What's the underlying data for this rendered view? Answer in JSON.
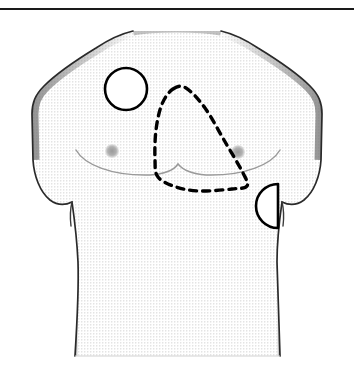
{
  "figure": {
    "kind": "anatomical-line-drawing",
    "canvas": {
      "width": 354,
      "height": 374
    },
    "background_color": "#ffffff",
    "ink_color": "#000000",
    "skin_fill_color": "#fcfcfc",
    "stipple_color": "#b9b9b9",
    "shade_color": "#8f8f8f",
    "nipple_color": "#a8a8a8",
    "fold_line_color": "#9a9a9a"
  },
  "rule": {
    "name": "top-horizontal-rule",
    "y": 9,
    "x_start": 0,
    "x_end": 354,
    "thickness": 2.2,
    "color": "#1a1a1a"
  },
  "torso": {
    "label": "male-chest-torso",
    "neck_left_x": 133,
    "neck_right_x": 218,
    "neck_top_y": 31,
    "shoulder_left_x": 32,
    "shoulder_right_x": 322,
    "armpit_left": {
      "x": 72,
      "y": 202
    },
    "armpit_right": {
      "x": 277,
      "y": 200
    },
    "waist_left_x": 78,
    "waist_right_x": 274,
    "bottom_y": 356,
    "outline_width": 1.6
  },
  "nipples": [
    {
      "name": "nipple-left",
      "cx": 112,
      "cy": 151,
      "r": 7
    },
    {
      "name": "nipple-right",
      "cx": 238,
      "cy": 152,
      "r": 7
    }
  ],
  "pectoral_folds": [
    {
      "name": "inframammary-fold-left",
      "from_x": 74,
      "to_x": 177,
      "y": 173
    },
    {
      "name": "inframammary-fold-right",
      "from_x": 177,
      "to_x": 278,
      "y": 173
    }
  ],
  "markers": [
    {
      "name": "circle-marker-upper-right-chest",
      "shape": "circle",
      "cx": 126,
      "cy": 89,
      "r": 21,
      "stroke": "#000000",
      "stroke_width": 2.6,
      "fill": "#ffffff",
      "dashed": false
    },
    {
      "name": "semicircle-marker-left-axilla",
      "shape": "semicircle",
      "flat_edge_x": 278,
      "cy": 206,
      "r": 22,
      "bulge_direction": "left",
      "stroke": "#000000",
      "stroke_width": 2.6,
      "fill": "#ffffff",
      "dashed": false
    },
    {
      "name": "dashed-cardiac-region",
      "shape": "closed-path",
      "stroke": "#000000",
      "stroke_width": 3.4,
      "fill": "none",
      "dashed": true,
      "dash_pattern": "7,6",
      "vertices": [
        {
          "x": 173,
          "y": 89
        },
        {
          "x": 186,
          "y": 88
        },
        {
          "x": 205,
          "y": 108
        },
        {
          "x": 224,
          "y": 140
        },
        {
          "x": 243,
          "y": 173
        },
        {
          "x": 247,
          "y": 186
        },
        {
          "x": 232,
          "y": 189
        },
        {
          "x": 200,
          "y": 191
        },
        {
          "x": 176,
          "y": 187
        },
        {
          "x": 158,
          "y": 177
        },
        {
          "x": 155,
          "y": 160
        },
        {
          "x": 156,
          "y": 130
        },
        {
          "x": 162,
          "y": 104
        }
      ]
    }
  ],
  "legend": {
    "has_text_labels": false,
    "note": "No textual labels are rendered in the image."
  }
}
